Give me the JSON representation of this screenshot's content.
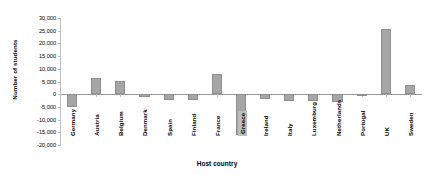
{
  "chart_data": {
    "type": "bar",
    "title": "",
    "xlabel": "Host country",
    "ylabel": "Number of students",
    "ylim": [
      -20000,
      30000
    ],
    "ytick_labels": [
      "30,000",
      "25,000",
      "20,000",
      "15,000",
      "10,000",
      "5,000",
      "0",
      "-5,000",
      "-10,000",
      "-15,000",
      "-20,000"
    ],
    "ytick_values": [
      30000,
      25000,
      20000,
      15000,
      10000,
      5000,
      0,
      -5000,
      -10000,
      -15000,
      -20000
    ],
    "grid": false,
    "legend": "none",
    "bar_color": "#a6a6a6",
    "bar_border_color": "#8f8f8f",
    "highlight_category": "Greece",
    "categories": [
      "Germany",
      "Austria",
      "Belgium",
      "Denmark",
      "Spain",
      "Finland",
      "France",
      "Greece",
      "Ireland",
      "Italy",
      "Luxemburg",
      "Netherlands",
      "Portugal",
      "UK",
      "Sweden"
    ],
    "values": [
      -5200,
      6300,
      5200,
      -1300,
      -2200,
      -2300,
      7800,
      -16200,
      -2000,
      -2500,
      -2600,
      -2900,
      -800,
      25500,
      3600
    ]
  }
}
